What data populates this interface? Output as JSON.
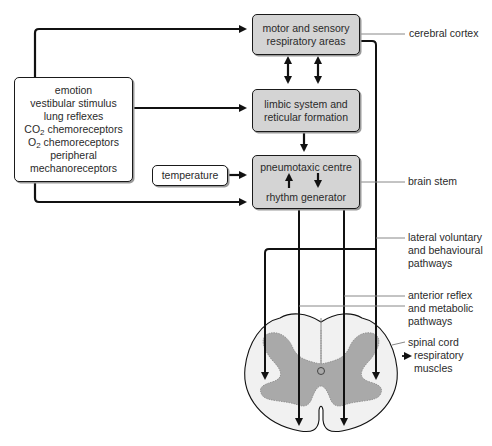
{
  "diagram": {
    "boxes": {
      "cortex_box": {
        "line1": "motor and sensory",
        "line2": "respiratory areas"
      },
      "limbic_box": {
        "line1": "limbic system and",
        "line2": "reticular formation"
      },
      "brainstem_box": {
        "line1": "pneumotaxic centre",
        "line2": "rhythm generator"
      },
      "inputs_box": {
        "items": [
          "emotion",
          "vestibular stimulus",
          "lung reflexes",
          "CO",
          "O",
          "peripheral",
          "mechanoreceptors"
        ],
        "co2_suffix": " chemoreceptors",
        "o2_suffix": " chemoreceptors",
        "subscript": "2"
      },
      "temperature_box": {
        "label": "temperature"
      }
    },
    "labels": {
      "cerebral_cortex": "cerebral cortex",
      "brain_stem": "brain stem",
      "lateral_pathways": [
        "lateral voluntary",
        "and behavioural",
        "pathways"
      ],
      "anterior_pathways": [
        "anterior reflex",
        "and metabolic",
        "pathways"
      ],
      "spinal_cord": "spinal cord",
      "respiratory_muscles": [
        "respiratory",
        "muscles"
      ]
    },
    "colors": {
      "box_grey": "#d4d4d4",
      "grey_matter": "#a8a8a8",
      "white_matter": "#eeeeee",
      "line": "#111111",
      "leader": "#888888"
    }
  }
}
